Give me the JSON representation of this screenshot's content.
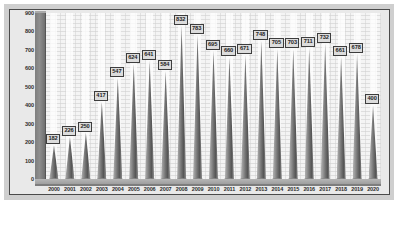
{
  "chart_data": {
    "type": "bar",
    "title": "",
    "subtitle": "",
    "xlabel": "",
    "ylabel": "",
    "ylim": [
      0,
      900
    ],
    "ytick_step": 100,
    "yticks": [
      900,
      800,
      700,
      600,
      500,
      400,
      300,
      200,
      100,
      0
    ],
    "grid": true,
    "legend": null,
    "style": "3d-cone",
    "categories": [
      "2000",
      "2001",
      "2002",
      "2003",
      "2004",
      "2005",
      "2006",
      "2007",
      "2008",
      "2009",
      "2010",
      "2011",
      "2012",
      "2013",
      "2014",
      "2015",
      "2016",
      "2017",
      "2018",
      "2019",
      "2020"
    ],
    "values": [
      182,
      226,
      250,
      417,
      547,
      624,
      641,
      584,
      832,
      783,
      695,
      660,
      671,
      748,
      705,
      703,
      711,
      732,
      661,
      678,
      400
    ],
    "data_labels": [
      "182",
      "226",
      "250",
      "417",
      "547",
      "624",
      "641",
      "584",
      "832",
      "783",
      "695",
      "660",
      "671",
      "748",
      "705",
      "703",
      "711",
      "732",
      "661",
      "678",
      "400"
    ]
  },
  "colors": {
    "plate": "#cfcfcf",
    "frame_border": "#4a4a4a",
    "plot_background": "#f4f4f4",
    "wall": "#8e8e8e",
    "floor": "#a8a8a8",
    "cone_light": "#b0b0b0",
    "cone_dark": "#575757",
    "label_fill": "#dcdcdc",
    "label_border": "#3d3d3d",
    "text": "#2b2b2b"
  },
  "caption": {
    "text": ""
  }
}
